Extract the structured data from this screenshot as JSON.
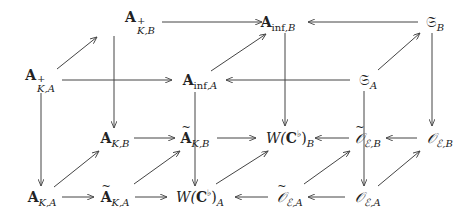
{
  "diagram": {
    "type": "commutative-cube-diagram",
    "nodes": {
      "AplusKB": {
        "base": "A",
        "sup": "+",
        "sub": "K,B",
        "x": 140,
        "y": 22
      },
      "AinfB": {
        "base": "A",
        "sub_roman": "inf",
        "sub": ",B",
        "x": 278,
        "y": 22
      },
      "SB": {
        "base": "𝔖",
        "sub": "B",
        "x": 435,
        "y": 22
      },
      "AplusKA": {
        "base": "A",
        "sup": "+",
        "sub": "K,A",
        "x": 40,
        "y": 80
      },
      "AinfA": {
        "base": "A",
        "sub_roman": "inf",
        "sub": ",A",
        "x": 200,
        "y": 80
      },
      "SA": {
        "base": "𝔖",
        "sub": "A",
        "x": 368,
        "y": 80
      },
      "AKB": {
        "base": "A",
        "sub": "K,B",
        "x": 115,
        "y": 138
      },
      "AtKB": {
        "base": "A",
        "tilde": true,
        "sub": "K,B",
        "x": 195,
        "y": 138
      },
      "WCB": {
        "pre": "W(",
        "base": "C",
        "sup": "♭",
        "post": ")",
        "sub": "B",
        "x": 290,
        "y": 138
      },
      "OtEB": {
        "base": "𝒪",
        "tilde": true,
        "sub": "ℰ,B",
        "x": 368,
        "y": 138
      },
      "OEB": {
        "base": "𝒪",
        "sub": "ℰ,B",
        "x": 440,
        "y": 138
      },
      "AKA": {
        "base": "A",
        "sub": "K,A",
        "x": 42,
        "y": 197
      },
      "AtKA": {
        "base": "A",
        "tilde": true,
        "sub": "K,A",
        "x": 115,
        "y": 197
      },
      "WCA": {
        "pre": "W(",
        "base": "C",
        "sup": "♭",
        "post": ")",
        "sub": "A",
        "x": 200,
        "y": 197
      },
      "OtEA": {
        "base": "𝒪",
        "tilde": true,
        "sub": "ℰ,A",
        "x": 290,
        "y": 197
      },
      "OEA": {
        "base": "𝒪",
        "sub": "ℰ,A",
        "x": 368,
        "y": 197
      }
    },
    "edges": [
      {
        "from": "AplusKB",
        "to": "AinfB",
        "x1": 162,
        "y1": 22,
        "x2": 262,
        "y2": 22
      },
      {
        "from": "SB",
        "to": "AinfB",
        "x1": 418,
        "y1": 22,
        "x2": 308,
        "y2": 22
      },
      {
        "from": "AplusKA",
        "to": "AplusKB",
        "x1": 57,
        "y1": 69,
        "x2": 97,
        "y2": 37
      },
      {
        "from": "AinfA",
        "to": "AinfB",
        "x1": 211,
        "y1": 71,
        "x2": 266,
        "y2": 34
      },
      {
        "from": "SA",
        "to": "SB",
        "x1": 378,
        "y1": 70,
        "x2": 420,
        "y2": 33
      },
      {
        "from": "AplusKA",
        "to": "AinfA",
        "x1": 62,
        "y1": 80,
        "x2": 172,
        "y2": 80
      },
      {
        "from": "SA",
        "to": "AinfA",
        "x1": 350,
        "y1": 80,
        "x2": 226,
        "y2": 80
      },
      {
        "from": "AplusKB",
        "to": "AKB",
        "x1": 114,
        "y1": 36,
        "x2": 114,
        "y2": 128
      },
      {
        "from": "AinfB",
        "to": "WCB",
        "x1": 285,
        "y1": 33,
        "x2": 285,
        "y2": 126
      },
      {
        "from": "SB",
        "to": "OEB",
        "x1": 432,
        "y1": 33,
        "x2": 432,
        "y2": 126
      },
      {
        "from": "AplusKA",
        "to": "AKA",
        "x1": 41,
        "y1": 93,
        "x2": 41,
        "y2": 186
      },
      {
        "from": "AinfA",
        "to": "WCA",
        "x1": 195,
        "y1": 92,
        "x2": 195,
        "y2": 186
      },
      {
        "from": "SA",
        "to": "OEA",
        "x1": 364,
        "y1": 91,
        "x2": 364,
        "y2": 186
      },
      {
        "from": "AKB",
        "to": "AtKB",
        "x1": 134,
        "y1": 138,
        "x2": 175,
        "y2": 138
      },
      {
        "from": "AtKB",
        "to": "WCB",
        "x1": 217,
        "y1": 138,
        "x2": 256,
        "y2": 138
      },
      {
        "from": "OtEB",
        "to": "WCB",
        "x1": 349,
        "y1": 138,
        "x2": 315,
        "y2": 138
      },
      {
        "from": "OEB",
        "to": "OtEB",
        "x1": 417,
        "y1": 138,
        "x2": 386,
        "y2": 138
      },
      {
        "from": "AKA",
        "to": "AtKA",
        "x1": 62,
        "y1": 197,
        "x2": 94,
        "y2": 197
      },
      {
        "from": "AtKA",
        "to": "WCA",
        "x1": 135,
        "y1": 197,
        "x2": 167,
        "y2": 197
      },
      {
        "from": "OtEA",
        "to": "WCA",
        "x1": 268,
        "y1": 197,
        "x2": 235,
        "y2": 197
      },
      {
        "from": "OEA",
        "to": "OtEA",
        "x1": 345,
        "y1": 197,
        "x2": 308,
        "y2": 197
      },
      {
        "from": "AKA",
        "to": "AKB",
        "x1": 54,
        "y1": 187,
        "x2": 99,
        "y2": 151
      },
      {
        "from": "AtKA",
        "to": "AtKB",
        "x1": 134,
        "y1": 184,
        "x2": 180,
        "y2": 151
      },
      {
        "from": "WCA",
        "to": "WCB",
        "x1": 216,
        "y1": 184,
        "x2": 268,
        "y2": 151
      },
      {
        "from": "OtEA",
        "to": "OtEB",
        "x1": 304,
        "y1": 184,
        "x2": 350,
        "y2": 151
      },
      {
        "from": "OEA",
        "to": "OEB",
        "x1": 378,
        "y1": 186,
        "x2": 420,
        "y2": 151
      }
    ],
    "colors": {
      "stroke": "#444444",
      "text": "#222222",
      "background": "#ffffff"
    }
  }
}
